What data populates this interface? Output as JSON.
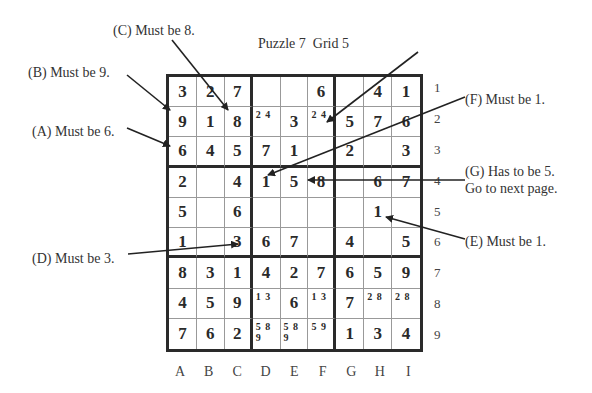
{
  "title": "Puzzle 7  Grid 5",
  "grid": {
    "cells": [
      [
        "3",
        "2",
        "7",
        "",
        "",
        "6",
        "",
        "4",
        "1"
      ],
      [
        "9",
        "1",
        "8",
        "",
        "3",
        "",
        "5",
        "7",
        "6"
      ],
      [
        "6",
        "4",
        "5",
        "7",
        "1",
        "",
        "2",
        "",
        "3"
      ],
      [
        "2",
        "",
        "4",
        "1",
        "5",
        "8",
        "",
        "6",
        "7"
      ],
      [
        "5",
        "",
        "6",
        "",
        "",
        "",
        "",
        "1",
        ""
      ],
      [
        "1",
        "",
        "3",
        "6",
        "7",
        "",
        "4",
        "",
        "5"
      ],
      [
        "8",
        "3",
        "1",
        "4",
        "2",
        "7",
        "6",
        "5",
        "9"
      ],
      [
        "4",
        "5",
        "9",
        "",
        "6",
        "",
        "7",
        "",
        ""
      ],
      [
        "7",
        "6",
        "2",
        "",
        "",
        "",
        "1",
        "3",
        "4"
      ]
    ],
    "candidates": [
      [
        "",
        "",
        "",
        "",
        "",
        "",
        "",
        "",
        ""
      ],
      [
        "",
        "",
        "",
        "24",
        "",
        "24",
        "",
        "",
        ""
      ],
      [
        "",
        "",
        "",
        "",
        "",
        "",
        "",
        "",
        ""
      ],
      [
        "",
        "",
        "",
        "",
        "",
        "",
        "",
        "",
        ""
      ],
      [
        "",
        "",
        "",
        "",
        "",
        "",
        "",
        "",
        ""
      ],
      [
        "",
        "",
        "",
        "",
        "",
        "",
        "",
        "",
        ""
      ],
      [
        "",
        "",
        "",
        "",
        "",
        "",
        "",
        "",
        ""
      ],
      [
        "",
        "",
        "",
        "13",
        "",
        "13",
        "",
        "28",
        "28"
      ],
      [
        "",
        "",
        "",
        "589",
        "589",
        "59",
        "",
        "",
        ""
      ]
    ]
  },
  "column_labels": [
    "A",
    "B",
    "C",
    "D",
    "E",
    "F",
    "G",
    "H",
    "I"
  ],
  "row_labels": [
    "1",
    "2",
    "3",
    "4",
    "5",
    "6",
    "7",
    "8",
    "9"
  ],
  "annotations": {
    "A": "(A) Must be 6.",
    "B": "(B) Must be 9.",
    "C": "(C) Must be 8.",
    "D": "(D) Must be 3.",
    "E": "(E) Must be 1.",
    "F": "(F) Must be 1.",
    "G1": "(G) Has to be 5.",
    "G2": "Go to next page."
  }
}
